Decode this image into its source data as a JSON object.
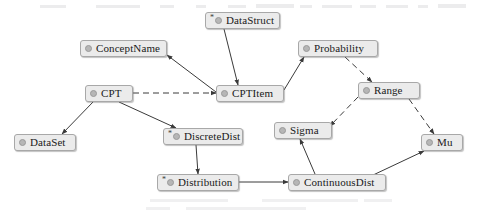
{
  "diagram": {
    "kind": "class-relationship-diagram",
    "background_color": "#ffffff",
    "node_fill_color": "#ebebeb",
    "node_border_color": "#a8a8a8",
    "node_glyph_color": "#b6b6b6",
    "edge_color": "#3a3a3a",
    "abstract_marker": "*",
    "nodes": [
      {
        "id": "datastruct",
        "label": "DataStruct",
        "abstract": true,
        "x": 205,
        "y": 12,
        "w": 75
      },
      {
        "id": "conceptname",
        "label": "ConceptName",
        "abstract": false,
        "x": 80,
        "y": 40,
        "w": 87
      },
      {
        "id": "probability",
        "label": "Probability",
        "abstract": false,
        "x": 298,
        "y": 40,
        "w": 80
      },
      {
        "id": "cpt",
        "label": "CPT",
        "abstract": false,
        "x": 85,
        "y": 85,
        "w": 48
      },
      {
        "id": "cptitem",
        "label": "CPTItem",
        "abstract": false,
        "x": 216,
        "y": 85,
        "w": 68
      },
      {
        "id": "range",
        "label": "Range",
        "abstract": false,
        "x": 358,
        "y": 82,
        "w": 62
      },
      {
        "id": "dataset",
        "label": "DataSet",
        "abstract": false,
        "x": 14,
        "y": 134,
        "w": 62
      },
      {
        "id": "discretedist",
        "label": "DiscreteDist",
        "abstract": true,
        "x": 163,
        "y": 128,
        "w": 80
      },
      {
        "id": "sigma",
        "label": "Sigma",
        "abstract": false,
        "x": 274,
        "y": 122,
        "w": 58
      },
      {
        "id": "mu",
        "label": "Mu",
        "abstract": false,
        "x": 421,
        "y": 134,
        "w": 42
      },
      {
        "id": "distribution",
        "label": "Distribution",
        "abstract": true,
        "x": 157,
        "y": 174,
        "w": 82
      },
      {
        "id": "continuousdist",
        "label": "ContinuousDist",
        "abstract": false,
        "x": 288,
        "y": 174,
        "w": 98
      }
    ],
    "edges": [
      {
        "from": "datastruct",
        "to": "cptitem",
        "style": "solid",
        "arrow": "to"
      },
      {
        "from": "cptitem",
        "to": "conceptname",
        "style": "solid",
        "arrow": "to"
      },
      {
        "from": "cptitem",
        "to": "probability",
        "style": "solid",
        "arrow": "to"
      },
      {
        "from": "cpt",
        "to": "cptitem",
        "style": "dashed",
        "arrow": "to"
      },
      {
        "from": "probability",
        "to": "range",
        "style": "dashed",
        "arrow": "to"
      },
      {
        "from": "range",
        "to": "sigma",
        "style": "dashed",
        "arrow": "to"
      },
      {
        "from": "range",
        "to": "mu",
        "style": "dashed",
        "arrow": "to"
      },
      {
        "from": "cpt",
        "to": "dataset",
        "style": "solid",
        "arrow": "to"
      },
      {
        "from": "cpt",
        "to": "discretedist",
        "style": "solid",
        "arrow": "to"
      },
      {
        "from": "discretedist",
        "to": "distribution",
        "style": "solid",
        "arrow": "to"
      },
      {
        "from": "distribution",
        "to": "continuousdist",
        "style": "solid",
        "arrow": "to"
      },
      {
        "from": "continuousdist",
        "to": "sigma",
        "style": "solid",
        "arrow": "to"
      },
      {
        "from": "continuousdist",
        "to": "mu",
        "style": "solid",
        "arrow": "to"
      }
    ]
  }
}
